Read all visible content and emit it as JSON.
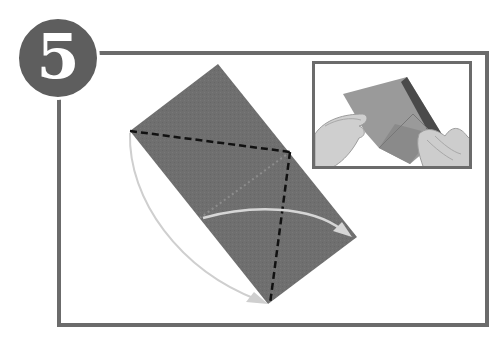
{
  "step": {
    "number": "5",
    "badge_color": "#5e5e5e",
    "frame_color": "#6b6b6b"
  },
  "diagram": {
    "paper_color": "#6f6f6f",
    "fold_line_color": "#111111",
    "arrow_color": "#c8c8c8",
    "elements": [
      "paper-rectangle",
      "valley-fold-diagonal",
      "valley-fold-vertical",
      "crease-guide-dotted",
      "fold-arrow-right",
      "fold-arrow-down"
    ]
  },
  "photo": {
    "description": "hands folding paper",
    "shows": "photo-inset"
  }
}
